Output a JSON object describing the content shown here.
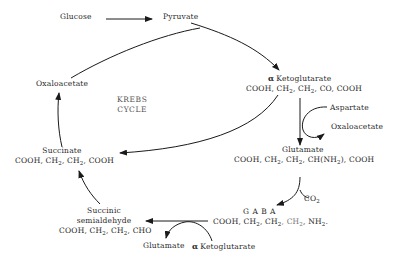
{
  "diagram": {
    "title": "KREBS CYCLE",
    "center_label": [
      "KREBS",
      "CYCLE"
    ],
    "nodes": {
      "glucose": {
        "name": "Glucose"
      },
      "pyruvate": {
        "name": "Pyruvate"
      },
      "oxaloacetate_cycle": {
        "name": "Oxaloacetate"
      },
      "alpha_ketoglutarate": {
        "prefix": "α",
        "name": "Ketoglutarate",
        "formula": [
          "COOH, CH",
          "2",
          ", CH",
          "2",
          ", CO, COOH"
        ]
      },
      "aspartate": {
        "name": "Aspartate"
      },
      "oxaloacetate_side": {
        "name": "Oxaloacetate"
      },
      "glutamate": {
        "name": "Glutamate",
        "formula": [
          "COOH, CH",
          "2",
          ", CH",
          "2",
          ", CH(NH",
          "2",
          "), COOH"
        ]
      },
      "co2": {
        "name": "CO",
        "sub": "2"
      },
      "gaba": {
        "name": "G A B A",
        "formula": [
          "COOH, CH",
          "2",
          ", CH",
          "2",
          ", CH",
          "2",
          ", NH",
          "2",
          "."
        ]
      },
      "succinic_semialdehyde": {
        "name_line1": "Succinic",
        "name_line2": "semialdehyde",
        "formula": [
          "COOH, CH",
          "2",
          ", CH",
          "2",
          ", CHO"
        ]
      },
      "glutamate_side": {
        "name": "Glutamate"
      },
      "alpha_ketoglutarate_side": {
        "prefix": "α",
        "name": "Ketoglutarate"
      },
      "succinate": {
        "name": "Succinate",
        "formula": [
          "COOH, CH",
          "2",
          ", CH",
          "2",
          ", COOH"
        ]
      }
    },
    "edges": [
      {
        "from": "Glucose",
        "to": "Pyruvate"
      },
      {
        "from": "Pyruvate",
        "to": "α Ketoglutarate"
      },
      {
        "from": "Oxaloacetate",
        "to": "α Ketoglutarate"
      },
      {
        "from": "α Ketoglutarate",
        "to": "Succinate"
      },
      {
        "from": "α Ketoglutarate",
        "to": "Glutamate",
        "co_in": "Aspartate",
        "co_out": "Oxaloacetate"
      },
      {
        "from": "Glutamate",
        "to": "GABA",
        "co_out": "CO2"
      },
      {
        "from": "GABA",
        "to": "Succinic semialdehyde",
        "co_in": "α Ketoglutarate",
        "co_out": "Glutamate"
      },
      {
        "from": "Succinic semialdehyde",
        "to": "Succinate"
      },
      {
        "from": "Succinate",
        "to": "Oxaloacetate"
      }
    ],
    "colors": {
      "line": "#1a1a1a",
      "text": "#2a2a2a",
      "background": "#ffffff"
    }
  }
}
